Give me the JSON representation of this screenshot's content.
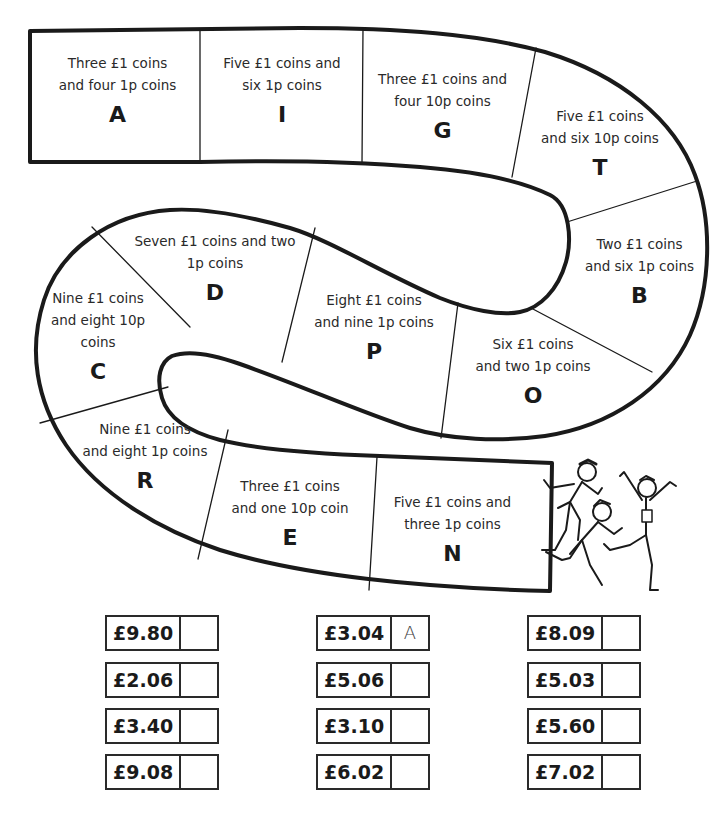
{
  "track": {
    "cells": [
      {
        "id": "A",
        "desc_lines": [
          "Three £1 coins",
          "and four 1p coins"
        ],
        "letter": "A"
      },
      {
        "id": "I",
        "desc_lines": [
          "Five £1 coins and",
          "six 1p coins"
        ],
        "letter": "I"
      },
      {
        "id": "G",
        "desc_lines": [
          "Three £1 coins and",
          "four 10p coins"
        ],
        "letter": "G"
      },
      {
        "id": "T",
        "desc_lines": [
          "Five £1 coins",
          "and six 10p coins"
        ],
        "letter": "T"
      },
      {
        "id": "B",
        "desc_lines": [
          "Two £1 coins",
          "and six 1p coins"
        ],
        "letter": "B"
      },
      {
        "id": "O",
        "desc_lines": [
          "Six £1 coins",
          "and two 1p coins"
        ],
        "letter": "O"
      },
      {
        "id": "P",
        "desc_lines": [
          "Eight £1 coins",
          "and nine 1p coins"
        ],
        "letter": "P"
      },
      {
        "id": "D",
        "desc_lines": [
          "Seven £1 coins and two",
          "1p coins"
        ],
        "letter": "D"
      },
      {
        "id": "C",
        "desc_lines": [
          "Nine £1 coins",
          "and eight 10p",
          "coins"
        ],
        "letter": "C"
      },
      {
        "id": "R",
        "desc_lines": [
          "Nine £1 coins",
          "and eight 1p coins"
        ],
        "letter": "R"
      },
      {
        "id": "E",
        "desc_lines": [
          "Three £1 coins",
          "and one 10p coin"
        ],
        "letter": "E"
      },
      {
        "id": "N",
        "desc_lines": [
          "Five £1 coins and",
          "three 1p coins"
        ],
        "letter": "N"
      }
    ]
  },
  "illustration": {
    "icon": "runners-finishing-race-icon"
  },
  "answers": {
    "columns": [
      [
        {
          "amount": "£9.80",
          "answer": ""
        },
        {
          "amount": "£2.06",
          "answer": ""
        },
        {
          "amount": "£3.40",
          "answer": ""
        },
        {
          "amount": "£9.08",
          "answer": ""
        }
      ],
      [
        {
          "amount": "£3.04",
          "answer": "A"
        },
        {
          "amount": "£5.06",
          "answer": ""
        },
        {
          "amount": "£3.10",
          "answer": ""
        },
        {
          "amount": "£6.02",
          "answer": ""
        }
      ],
      [
        {
          "amount": "£8.09",
          "answer": ""
        },
        {
          "amount": "£5.03",
          "answer": ""
        },
        {
          "amount": "£5.60",
          "answer": ""
        },
        {
          "amount": "£7.02",
          "answer": ""
        }
      ]
    ]
  }
}
